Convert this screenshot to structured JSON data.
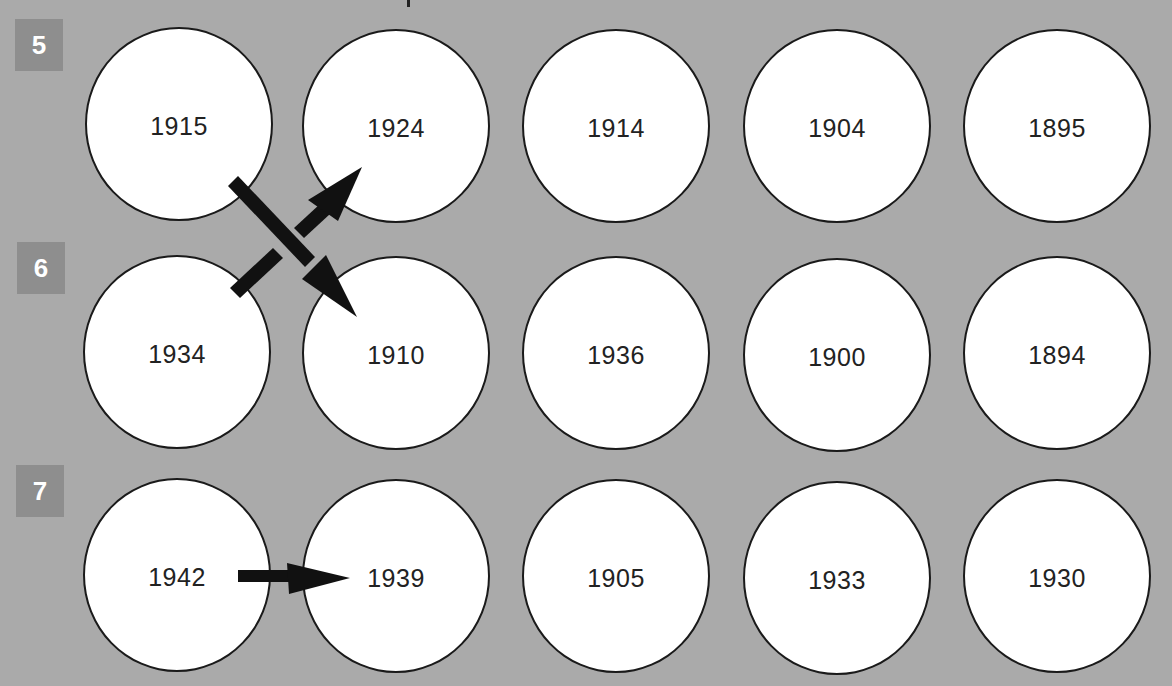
{
  "colors": {
    "background": "#aaaaaa",
    "badge": "#8e8e8e",
    "badge_text": "#ffffff",
    "circle_fill": "#ffffff",
    "circle_stroke": "#1a1a1a",
    "arrow": "#111111"
  },
  "rows": [
    {
      "label": "5",
      "years": [
        "1915",
        "1924",
        "1914",
        "1904",
        "1895"
      ]
    },
    {
      "label": "6",
      "years": [
        "1934",
        "1910",
        "1936",
        "1900",
        "1894"
      ]
    },
    {
      "label": "7",
      "years": [
        "1942",
        "1939",
        "1905",
        "1933",
        "1930"
      ]
    }
  ],
  "arrows": [
    {
      "from": "1915",
      "to": "1910",
      "style": "solid",
      "direction": "down-right"
    },
    {
      "from": "1934",
      "to": "1924",
      "style": "broken-under",
      "direction": "up-right"
    },
    {
      "from": "1942",
      "to": "1939",
      "style": "solid",
      "direction": "right"
    }
  ]
}
